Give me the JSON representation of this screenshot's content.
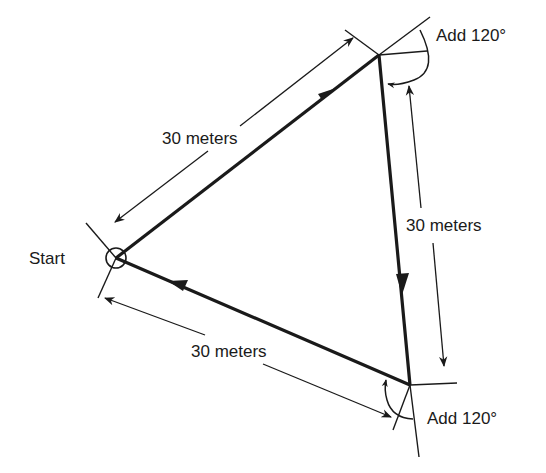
{
  "diagram": {
    "start_label": "Start",
    "side_labels": [
      "30 meters",
      "30 meters",
      "30 meters"
    ],
    "turn_labels": [
      "Add 120°",
      "Add 120°"
    ],
    "colors": {
      "ink": "#1a1a1a",
      "background": "#ffffff"
    }
  }
}
